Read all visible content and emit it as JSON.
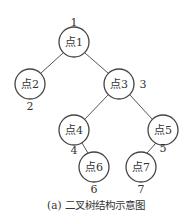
{
  "caption": "(a) 二叉树结构示意图",
  "nodes": [
    {
      "id": "1",
      "label": "点1",
      "number": "1",
      "cx": 74,
      "cy": 42
    },
    {
      "id": "2",
      "label": "点2",
      "number": "2",
      "cx": 30,
      "cy": 84
    },
    {
      "id": "3",
      "label": "点3",
      "number": "3",
      "cx": 119,
      "cy": 84
    },
    {
      "id": "4",
      "label": "点4",
      "number": "4",
      "cx": 74,
      "cy": 130
    },
    {
      "id": "5",
      "label": "点5",
      "number": "5",
      "cx": 163,
      "cy": 130
    },
    {
      "id": "6",
      "label": "点6",
      "number": "6",
      "cx": 94,
      "cy": 167
    },
    {
      "id": "7",
      "label": "点7",
      "number": "7",
      "cx": 141,
      "cy": 167
    }
  ],
  "edges": [
    [
      "1",
      "2"
    ],
    [
      "1",
      "3"
    ],
    [
      "3",
      "4"
    ],
    [
      "3",
      "5"
    ],
    [
      "4",
      "6"
    ],
    [
      "5",
      "7"
    ]
  ]
}
